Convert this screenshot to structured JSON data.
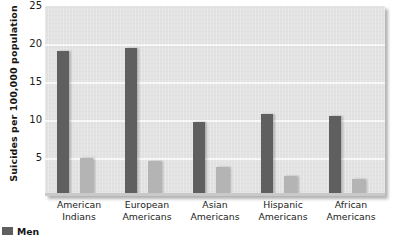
{
  "chart_data": {
    "type": "bar",
    "title": "",
    "xlabel": "",
    "ylabel": "Suicides per 100,000 population",
    "ylim": [
      0,
      25
    ],
    "yticks": [
      5,
      10,
      15,
      20,
      25
    ],
    "grid": true,
    "legend_position": "bottom-left",
    "categories": [
      "American Indians",
      "European Americans",
      "Asian Americans",
      "Hispanic Americans",
      "African Americans"
    ],
    "category_lines": [
      [
        "American",
        "Indians"
      ],
      [
        "European",
        "Americans"
      ],
      [
        "Asian",
        "Americans"
      ],
      [
        "Hispanic",
        "Americans"
      ],
      [
        "African",
        "Americans"
      ]
    ],
    "series": [
      {
        "name": "Men",
        "color": "#5f5f5f",
        "values": [
          19.1,
          19.5,
          9.7,
          10.8,
          10.5
        ]
      },
      {
        "name": "Women",
        "color": "#b4b4b4",
        "values": [
          5.0,
          4.6,
          3.8,
          2.6,
          2.3
        ]
      }
    ]
  },
  "legend": {
    "men_label": "Men"
  },
  "colors": {
    "men": "#5f5f5f",
    "women": "#b4b4b4",
    "plot_background": "#e2e2e2",
    "gridline": "#f7f7f7",
    "text": "#1b1b1b"
  }
}
